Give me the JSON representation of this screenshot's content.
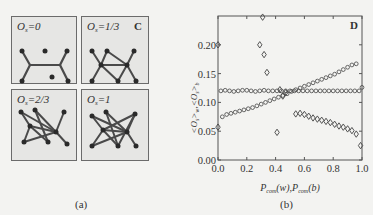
{
  "figure_a": {
    "caption": "(a)",
    "corner_label": "C",
    "panels": [
      {
        "label_var": "O",
        "label_sub": "s",
        "label_val": "=0"
      },
      {
        "label_var": "O",
        "label_sub": "s",
        "label_val": "=1/3"
      },
      {
        "label_var": "O",
        "label_sub": "s",
        "label_val": "=2/3"
      },
      {
        "label_var": "O",
        "label_sub": "s",
        "label_val": "=1"
      }
    ]
  },
  "figure_b": {
    "caption": "(b)",
    "corner_label": "D"
  },
  "chart_data": {
    "type": "scatter",
    "title": "",
    "panel_label": "D",
    "xlabel": "P_com(w), P_com(b)",
    "ylabel": "<O_s>_w, <O_s>_b",
    "xlim": [
      0.0,
      1.0
    ],
    "ylim": [
      0.0,
      0.25
    ],
    "xticks": [
      "0.0",
      "0.2",
      "0.4",
      "0.6",
      "0.8",
      "1.0"
    ],
    "yticks": [
      "0.00",
      "0.05",
      "0.10",
      "0.15",
      "0.20"
    ],
    "grid": false,
    "legend": "none",
    "series": [
      {
        "name": "flat circles",
        "marker": "circle",
        "x": [
          0.02,
          0.05,
          0.08,
          0.11,
          0.14,
          0.17,
          0.2,
          0.23,
          0.26,
          0.29,
          0.32,
          0.35,
          0.38,
          0.41,
          0.44,
          0.47,
          0.5,
          0.53,
          0.56,
          0.59,
          0.62,
          0.65,
          0.68,
          0.71,
          0.74,
          0.77,
          0.8,
          0.83,
          0.86,
          0.89,
          0.92,
          0.95,
          0.98
        ],
        "y": [
          0.12,
          0.121,
          0.12,
          0.119,
          0.12,
          0.121,
          0.121,
          0.12,
          0.119,
          0.12,
          0.121,
          0.12,
          0.12,
          0.12,
          0.12,
          0.12,
          0.12,
          0.12,
          0.12,
          0.12,
          0.12,
          0.12,
          0.12,
          0.12,
          0.12,
          0.12,
          0.12,
          0.12,
          0.12,
          0.12,
          0.12,
          0.12,
          0.12
        ]
      },
      {
        "name": "rising circles",
        "marker": "circle",
        "x": [
          0.03,
          0.06,
          0.09,
          0.12,
          0.15,
          0.18,
          0.21,
          0.24,
          0.27,
          0.3,
          0.33,
          0.36,
          0.39,
          0.42,
          0.45,
          0.48,
          0.51,
          0.54,
          0.57,
          0.6,
          0.63,
          0.66,
          0.69,
          0.72,
          0.75,
          0.78,
          0.81,
          0.84,
          0.87,
          0.9,
          0.93,
          0.96,
          1.0
        ],
        "y": [
          0.075,
          0.079,
          0.081,
          0.083,
          0.085,
          0.087,
          0.089,
          0.091,
          0.094,
          0.097,
          0.1,
          0.103,
          0.106,
          0.109,
          0.112,
          0.115,
          0.119,
          0.122,
          0.125,
          0.128,
          0.131,
          0.134,
          0.137,
          0.14,
          0.143,
          0.146,
          0.149,
          0.153,
          0.157,
          0.161,
          0.165,
          0.167,
          0.126
        ]
      },
      {
        "name": "diamonds",
        "marker": "diamond",
        "x": [
          0.0,
          0.0,
          0.29,
          0.31,
          0.32,
          0.34,
          0.41,
          0.43,
          0.45,
          0.47,
          0.54,
          0.57,
          0.6,
          0.63,
          0.66,
          0.69,
          0.72,
          0.75,
          0.78,
          0.81,
          0.84,
          0.87,
          0.9,
          0.93,
          0.96,
          0.99
        ],
        "y": [
          0.2,
          0.057,
          0.2,
          0.248,
          0.183,
          0.152,
          0.048,
          0.122,
          0.111,
          0.117,
          0.08,
          0.081,
          0.079,
          0.076,
          0.073,
          0.071,
          0.069,
          0.067,
          0.065,
          0.062,
          0.059,
          0.057,
          0.054,
          0.051,
          0.045,
          0.025
        ]
      }
    ]
  }
}
